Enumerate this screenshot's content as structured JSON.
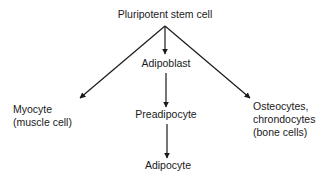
{
  "diagram": {
    "type": "cell-differentiation-tree",
    "nodes": {
      "root": {
        "label": "Pluripotent stem cell"
      },
      "adipoblast": {
        "label": "Adipoblast"
      },
      "preadipocyte": {
        "label": "Preadipocyte"
      },
      "adipocyte": {
        "label": "Adipocyte"
      },
      "myocyte": {
        "lines": [
          "Myocyte",
          "(muscle cell)"
        ]
      },
      "osteocytes": {
        "lines": [
          "Osteocytes,",
          "chrondocytes",
          "(bone cells)"
        ]
      }
    },
    "edges": [
      {
        "from": "root",
        "to": "myocyte"
      },
      {
        "from": "root",
        "to": "adipoblast"
      },
      {
        "from": "root",
        "to": "osteocytes"
      },
      {
        "from": "adipoblast",
        "to": "preadipocyte"
      },
      {
        "from": "preadipocyte",
        "to": "adipocyte"
      }
    ],
    "colors": {
      "line": "#1a1a1a",
      "text": "#1a1a1a",
      "background": "#ffffff"
    }
  }
}
